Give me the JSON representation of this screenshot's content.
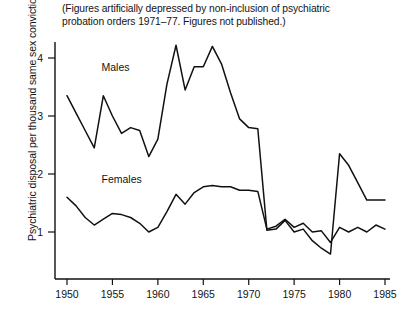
{
  "note": {
    "line1": "(Figures artificially depressed by non-inclusion of psychiatric",
    "line2": "probation orders 1971–77. Figures not published.)"
  },
  "chart_data": {
    "type": "line",
    "title": "",
    "subtitle": "(Figures artificially depressed by non-inclusion of psychiatric probation orders 1971–77. Figures not published.)",
    "xlabel": "",
    "ylabel": "Psychiatric disposal per thousand same sex convictions",
    "xlim": [
      1949,
      1985
    ],
    "ylim": [
      0,
      4.6
    ],
    "xticks": [
      1950,
      1955,
      1960,
      1965,
      1970,
      1975,
      1980,
      1985
    ],
    "xticklabels": [
      "1950",
      "1955",
      "1960",
      "1965",
      "1970",
      "1975",
      "1980",
      "1985"
    ],
    "yticks": [
      1,
      2,
      3,
      4
    ],
    "yticklabels": [
      "1",
      "2",
      "3",
      "4"
    ],
    "grid": false,
    "legend": "inline-annotations",
    "x": [
      1950,
      1951,
      1952,
      1953,
      1954,
      1955,
      1956,
      1957,
      1958,
      1959,
      1960,
      1961,
      1962,
      1963,
      1964,
      1965,
      1966,
      1967,
      1968,
      1969,
      1970,
      1971,
      1972,
      1973,
      1974,
      1975,
      1976,
      1977,
      1978,
      1979,
      1980,
      1981,
      1982,
      1983,
      1984,
      1985
    ],
    "series": [
      {
        "name": "Males",
        "label": "Males",
        "values": [
          3.35,
          3.05,
          2.75,
          2.45,
          3.35,
          3.0,
          2.7,
          2.8,
          2.75,
          2.3,
          2.6,
          3.55,
          4.22,
          3.45,
          3.85,
          3.85,
          4.2,
          3.9,
          3.4,
          2.95,
          2.8,
          2.78,
          1.03,
          1.05,
          1.2,
          1.0,
          1.05,
          0.85,
          0.72,
          0.62,
          2.35,
          2.15,
          1.85,
          1.55,
          1.55,
          1.55
        ]
      },
      {
        "name": "Females",
        "label": "Females",
        "values": [
          1.6,
          1.45,
          1.25,
          1.12,
          1.22,
          1.32,
          1.3,
          1.25,
          1.15,
          1.0,
          1.08,
          1.35,
          1.65,
          1.48,
          1.68,
          1.78,
          1.8,
          1.78,
          1.78,
          1.72,
          1.72,
          1.7,
          1.05,
          1.1,
          1.22,
          1.08,
          1.15,
          1.0,
          1.02,
          0.82,
          1.08,
          1.0,
          1.08,
          1.0,
          1.12,
          1.05
        ]
      }
    ],
    "annotations": [
      {
        "text": "Males",
        "x": 1953.8,
        "y": 3.78
      },
      {
        "text": "Females",
        "x": 1953.8,
        "y": 1.84
      }
    ]
  }
}
